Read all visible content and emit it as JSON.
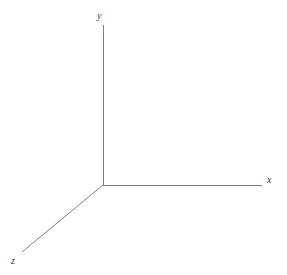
{
  "figure": {
    "type": "diagram",
    "background_color": "#ffffff",
    "width": 287,
    "height": 275,
    "line_color": "#808080",
    "label_color": "#3a3a3a",
    "line_width": 1
  },
  "origin": {
    "x": 103,
    "y": 185
  },
  "axes": [
    {
      "id": "y",
      "label": "y",
      "direction": "up",
      "x1": 103,
      "y1": 185,
      "x2": 103,
      "y2": 25
    },
    {
      "id": "x",
      "label": "x",
      "direction": "right",
      "x1": 103,
      "y1": 185,
      "x2": 262,
      "y2": 185
    },
    {
      "id": "z",
      "label": "z",
      "direction": "down-left",
      "x1": 103,
      "y1": 185,
      "x2": 22,
      "y2": 252
    }
  ],
  "labels": {
    "y": "y",
    "x": "x",
    "z": "z"
  }
}
